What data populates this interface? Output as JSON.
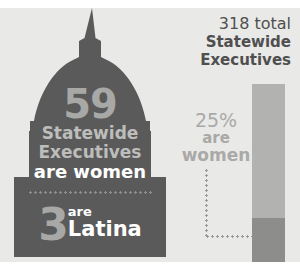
{
  "colors": {
    "background": "#e9e9e7",
    "page": "#ffffff",
    "silhouette": "#5a5a5a",
    "light_text": "#bdbdbb",
    "number_gray": "#a8a8a6",
    "white_text": "#ffffff",
    "header_text": "#4f4f4f",
    "bar_total": "#b2b2b0",
    "bar_women": "#8d8d8b",
    "dot_line": "#9a9a9a"
  },
  "capitol": {
    "icon": "capitol-dome-icon",
    "count": "59",
    "label_line1": "Statewide",
    "label_line2": "Executives",
    "label_line3": "are women",
    "latina_count": "3",
    "latina_line1": "are",
    "latina_line2": "Latina"
  },
  "panel": {
    "header_line1": "318 total",
    "header_line2": "Statewide",
    "header_line3": "Executives",
    "percent": "25%",
    "percent_line2": "are",
    "percent_line3": "women"
  },
  "chart_data": {
    "type": "bar",
    "title": "318 total Statewide Executives",
    "categories": [
      "Statewide Executives"
    ],
    "series": [
      {
        "name": "Total Statewide Executives",
        "values": [
          318
        ]
      },
      {
        "name": "Women Statewide Executives",
        "values": [
          59
        ]
      },
      {
        "name": "Latina Statewide Executives",
        "values": [
          3
        ]
      }
    ],
    "annotations": [
      {
        "text": "59 Statewide Executives are women",
        "value": 59
      },
      {
        "text": "3 are Latina",
        "value": 3
      },
      {
        "text": "25% are women",
        "value": 25,
        "unit": "%"
      },
      {
        "text": "318 total Statewide Executives",
        "value": 318
      }
    ],
    "xlabel": "",
    "ylabel": "",
    "ylim": [
      0,
      318
    ],
    "grid": false,
    "legend": "none",
    "stacked_fraction_women": 0.25
  }
}
